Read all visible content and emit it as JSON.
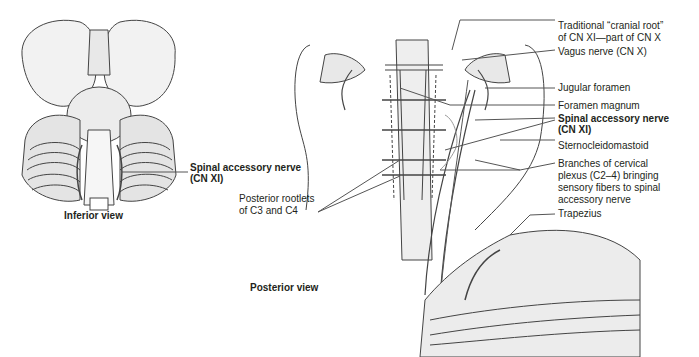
{
  "figure": {
    "views": {
      "inferior": "Inferior view",
      "posterior": "Posterior view"
    },
    "inferior_labels": {
      "spinal_accessory_line1": "Spinal accessory nerve",
      "spinal_accessory_line2": "(CN XI)"
    },
    "posterior_labels": {
      "cranial_root_line1": "Traditional “cranial root”",
      "cranial_root_line2": "of CN XI—part of CN X",
      "vagus": "Vagus nerve (CN X)",
      "jugular_foramen": "Jugular foramen",
      "foramen_magnum": "Foramen magnum",
      "spinal_accessory_line1": "Spinal accessory nerve",
      "spinal_accessory_line2": "(CN XI)",
      "sternocleidomastoid": "Sternocleidomastoid",
      "branches_line1": "Branches of cervical",
      "branches_line2": "plexus (C2–4) bringing",
      "branches_line3": "sensory fibers to spinal",
      "branches_line4": "accessory nerve",
      "trapezius": "Trapezius",
      "rootlets_line1": "Posterior rootlets",
      "rootlets_line2": "of C3 and C4"
    }
  }
}
